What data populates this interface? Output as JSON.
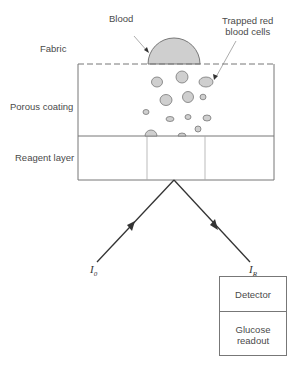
{
  "diagram": {
    "type": "schematic",
    "labels": {
      "blood": "Blood",
      "trapped_cells_line1": "Trapped red",
      "trapped_cells_line2": "blood cells",
      "fabric": "Fabric",
      "porous_coating": "Porous coating",
      "reagent_layer": "Reagent layer",
      "incident_light": "I",
      "incident_sub": "0",
      "reflected_light": "I",
      "reflected_sub": "R",
      "detector": "Detector",
      "readout_line1": "Glucose",
      "readout_line2": "readout"
    },
    "colors": {
      "fill_gray": "#cfcfcf",
      "stroke": "#666666",
      "arrow": "#333333"
    }
  }
}
